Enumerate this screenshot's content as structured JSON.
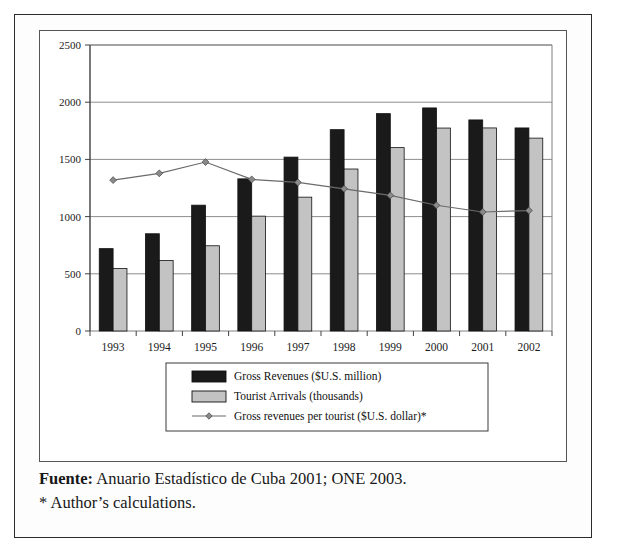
{
  "figure": {
    "source_label": "Fuente:",
    "source_text": " Anuario Estadístico de Cuba 2001; ONE 2003.",
    "footnote": "* Author’s calculations."
  },
  "colors": {
    "bar_dark": "#1a1a1a",
    "bar_light": "#c3c3c3",
    "line": "#6b6b6b",
    "marker": "#8a8a8a",
    "grid": "#808080",
    "axis": "#404040",
    "frame": "#2b2b2b",
    "panel_bg": "#ffffff",
    "page_bg": "#ffffff"
  },
  "chart_data": {
    "type": "bar",
    "title": "",
    "subtitle": "",
    "xlabel": "",
    "ylabel": "",
    "ylim": [
      0,
      2500
    ],
    "yticks": [
      0,
      500,
      1000,
      1500,
      2000,
      2500
    ],
    "ytick_labels": [
      "0",
      "500",
      "1000",
      "1500",
      "2000",
      "2500"
    ],
    "grid": true,
    "legend_position": "bottom",
    "categories": [
      "1993",
      "1994",
      "1995",
      "1996",
      "1997",
      "1998",
      "1999",
      "2000",
      "2001",
      "2002"
    ],
    "series": [
      {
        "name": "Gross Revenues ($U.S. million)",
        "kind": "bar",
        "fill": "#1a1a1a",
        "values": [
          720,
          850,
          1100,
          1330,
          1520,
          1760,
          1900,
          1950,
          1845,
          1775
        ]
      },
      {
        "name": "Tourist Arrivals (thousands)",
        "kind": "bar",
        "fill": "#c3c3c3",
        "values": [
          546,
          617,
          745,
          1004,
          1170,
          1416,
          1603,
          1774,
          1775,
          1686
        ]
      },
      {
        "name": "Gross revenues per tourist ($U.S. dollar)*",
        "kind": "line",
        "marker": "diamond",
        "stroke": "#6b6b6b",
        "values": [
          1319,
          1378,
          1477,
          1325,
          1299,
          1243,
          1185,
          1099,
          1040,
          1053
        ]
      }
    ]
  }
}
